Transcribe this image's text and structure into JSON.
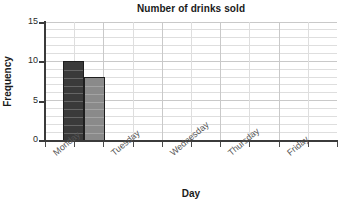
{
  "chart_data": {
    "type": "bar",
    "title": "Number of drinks sold",
    "xlabel": "Day",
    "ylabel": "Frequency",
    "categories": [
      "Monday",
      "Tuesday",
      "Wednesday",
      "Thursday",
      "Friday"
    ],
    "series": [
      {
        "name": "bar-1",
        "values": [
          10,
          null,
          null,
          null,
          null
        ],
        "color": "#3a3a3a"
      },
      {
        "name": "bar-2",
        "values": [
          8,
          null,
          null,
          null,
          null
        ],
        "color": "#8a8a8a"
      }
    ],
    "ylim": [
      0,
      15
    ],
    "ytick_labels": [
      "0",
      "5",
      "10",
      "15"
    ],
    "ytick_values": [
      0,
      5,
      10,
      15
    ],
    "minor_gridline_step": 1,
    "grid": true,
    "legend": "none",
    "bar_values_visible": [
      10,
      8
    ]
  },
  "axes": {
    "y": {
      "ticks": [
        {
          "value": 15,
          "label": "15"
        },
        {
          "value": 10,
          "label": "10"
        },
        {
          "value": 5,
          "label": "5"
        },
        {
          "value": 0,
          "label": "0"
        }
      ]
    },
    "x": {
      "categories": [
        {
          "label": "Monday"
        },
        {
          "label": "Tuesday"
        },
        {
          "label": "Wednesday"
        },
        {
          "label": "Thursday"
        },
        {
          "label": "Friday"
        }
      ]
    }
  },
  "colors": {
    "bar_dark": "#3a3a3a",
    "bar_light": "#8a8a8a",
    "bar_outline": "#1e1e1e",
    "grid_major": "#c9c9c9",
    "grid_minor": "#dedede",
    "axis": "#3b3b3b",
    "text": "#1a1a1a",
    "tick_text": "#2a2a2a",
    "category_text": "#555555",
    "background": "#ffffff"
  }
}
